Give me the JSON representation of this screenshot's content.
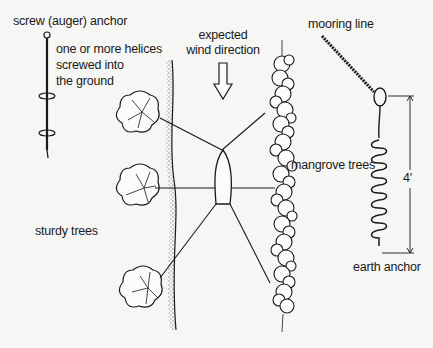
{
  "diagram": {
    "labels": {
      "screw_anchor": "screw (auger) anchor",
      "helices_line1": "one or more helices",
      "helices_line2": "screwed into",
      "helices_line3": "the ground",
      "wind_line1": "expected",
      "wind_line2": "wind direction",
      "mooring_line": "mooring line",
      "mangrove_trees": "mangrove trees",
      "sturdy_trees": "sturdy trees",
      "dimension": "4′",
      "earth_anchor": "earth anchor"
    },
    "elements": [
      {
        "name": "screw-anchor",
        "description": "vertical shaft with ring top and two helices"
      },
      {
        "name": "sturdy-tree",
        "count": 3
      },
      {
        "name": "shoreline-left"
      },
      {
        "name": "wind-arrow",
        "direction": "down"
      },
      {
        "name": "boat",
        "view": "top"
      },
      {
        "name": "mooring-lines",
        "count": 6
      },
      {
        "name": "mangrove-row"
      },
      {
        "name": "earth-anchor",
        "description": "coil anchor with eye, 4 ft dimension"
      }
    ],
    "colors": {
      "background": "#f6f6f4",
      "ink": "#1a1a1a"
    }
  }
}
